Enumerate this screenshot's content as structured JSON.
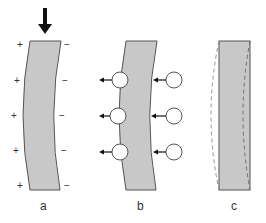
{
  "diagram": {
    "panels": [
      {
        "id": "a",
        "label": "a",
        "description": "curved plate under compressive load with surface charges"
      },
      {
        "id": "b",
        "label": "b",
        "description": "curved plate with ion/particle circles and arrows"
      },
      {
        "id": "c",
        "label": "c",
        "description": "straight plate with dashed outlines of bent states"
      }
    ],
    "signs": {
      "plus": "+",
      "minus": "−"
    },
    "colors": {
      "plate_fill": "#c8c8c8",
      "plate_stroke": "#555555",
      "dashed_stroke": "#888888",
      "arrow": "#111111"
    }
  }
}
